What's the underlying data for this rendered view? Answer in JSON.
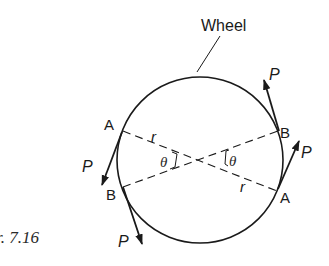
{
  "figure": {
    "caption": "Fig. 7.16",
    "caption_visible": "r. 7.16",
    "wheel_label": "Wheel",
    "points": {
      "upper_left": "A",
      "upper_right": "B",
      "lower_left": "B",
      "lower_right": "A"
    },
    "radius_label": "r",
    "angle_label": "θ",
    "force_label": "P",
    "colors": {
      "stroke": "#1a1a1a",
      "background": "#ffffff"
    }
  }
}
